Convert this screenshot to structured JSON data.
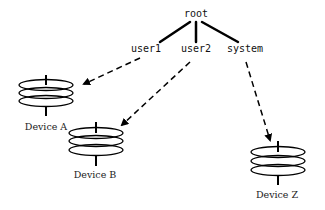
{
  "diagram": {
    "root": {
      "label": "root"
    },
    "accounts": [
      {
        "id": "user1",
        "label": "user1"
      },
      {
        "id": "user2",
        "label": "user2"
      },
      {
        "id": "system",
        "label": "system"
      }
    ],
    "devices": [
      {
        "id": "device-a",
        "label": "Device A"
      },
      {
        "id": "device-b",
        "label": "Device B"
      },
      {
        "id": "device-z",
        "label": "Device Z"
      }
    ],
    "edges": [
      {
        "from": "root",
        "to": "user1",
        "style": "solid"
      },
      {
        "from": "root",
        "to": "user2",
        "style": "solid"
      },
      {
        "from": "root",
        "to": "system",
        "style": "solid"
      },
      {
        "from": "user1",
        "to": "Device A",
        "style": "dashed-arrow"
      },
      {
        "from": "user2",
        "to": "Device B",
        "style": "dashed-arrow"
      },
      {
        "from": "system",
        "to": "Device Z",
        "style": "dashed-arrow"
      }
    ],
    "colors": {
      "stroke": "#000000",
      "background": "#ffffff"
    }
  }
}
